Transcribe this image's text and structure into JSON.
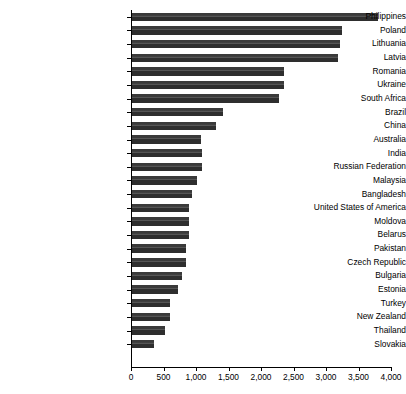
{
  "chart_data": {
    "type": "bar",
    "orientation": "horizontal",
    "title": "",
    "subtitle": "",
    "xlabel": "",
    "ylabel": "",
    "xlim": [
      0,
      4000
    ],
    "xticks": [
      0,
      500,
      1000,
      1500,
      2000,
      2500,
      3000,
      3500,
      4000
    ],
    "xtick_labels": [
      "0",
      "500",
      "1,000",
      "1,500",
      "2,000",
      "2,500",
      "3,000",
      "3,500",
      "4,000"
    ],
    "grid": false,
    "legend": null,
    "bar_color": "#333333",
    "categories": [
      "Philippines",
      "Poland",
      "Lithuania",
      "Latvia",
      "Romania",
      "Ukraine",
      "South Africa",
      "Brazil",
      "China",
      "Australia",
      "India",
      "Russian Federation",
      "Malaysia",
      "Bangladesh",
      "United States of America",
      "Moldova",
      "Belarus",
      "Pakistan",
      "Czech Republic",
      "Bulgaria",
      "Estonia",
      "Turkey",
      "New Zealand",
      "Thailand",
      "Slovakia"
    ],
    "values": [
      3800,
      3250,
      3210,
      3180,
      2360,
      2350,
      2270,
      1420,
      1300,
      1080,
      1085,
      1090,
      1010,
      945,
      890,
      890,
      890,
      850,
      850,
      790,
      720,
      600,
      595,
      525,
      360
    ]
  }
}
